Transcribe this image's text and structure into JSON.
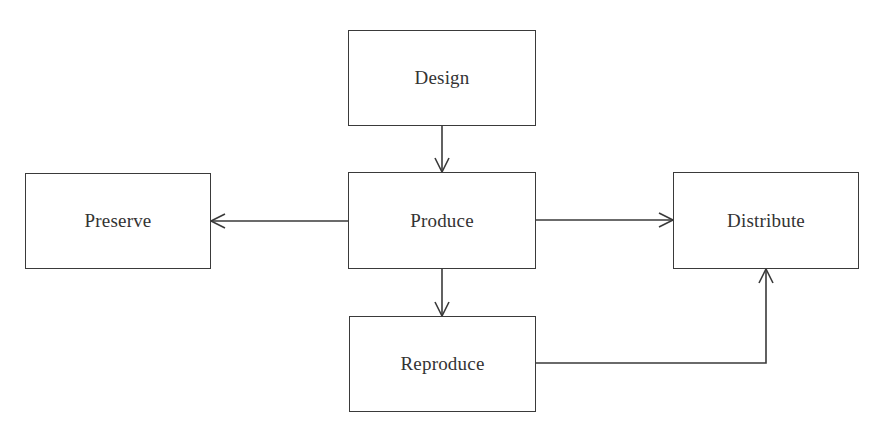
{
  "diagram": {
    "type": "flowchart",
    "line_color": "#3a3a3a",
    "text_color": "#333333",
    "background": "#ffffff",
    "nodes": [
      {
        "id": "design",
        "label": "Design"
      },
      {
        "id": "produce",
        "label": "Produce"
      },
      {
        "id": "preserve",
        "label": "Preserve"
      },
      {
        "id": "distribute",
        "label": "Distribute"
      },
      {
        "id": "reproduce",
        "label": "Reproduce"
      }
    ],
    "edges": [
      {
        "from": "design",
        "to": "produce",
        "style": "straight-down"
      },
      {
        "from": "produce",
        "to": "preserve",
        "style": "straight-left"
      },
      {
        "from": "produce",
        "to": "distribute",
        "style": "straight-right"
      },
      {
        "from": "produce",
        "to": "reproduce",
        "style": "straight-down"
      },
      {
        "from": "reproduce",
        "to": "distribute",
        "style": "elbow-right-then-up"
      }
    ]
  }
}
